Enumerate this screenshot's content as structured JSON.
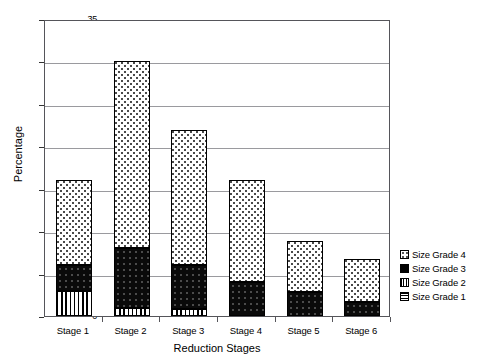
{
  "chart_data": {
    "type": "bar",
    "subtype": "stacked-bar",
    "title": "",
    "xlabel": "Reduction Stages",
    "ylabel": "Percentage",
    "categories": [
      "Stage 1",
      "Stage 2",
      "Stage 3",
      "Stage 4",
      "Stage 5",
      "Stage 6"
    ],
    "ylim": [
      0,
      35
    ],
    "yticks": [
      0,
      5,
      10,
      15,
      20,
      25,
      30,
      35
    ],
    "ytick_labels": [
      "0",
      "5",
      "10",
      "15",
      "20",
      "25",
      "30",
      "35"
    ],
    "grid": "horizontal",
    "legend_position": "right",
    "stack_order_bottom_to_top": [
      "Size Grade 1",
      "Size Grade 2",
      "Size Grade 3",
      "Size Grade 4"
    ],
    "series": [
      {
        "name": "Size Grade 1",
        "pattern": "horizontal-lines",
        "color": "#ffffff",
        "values": [
          0,
          0,
          0,
          0,
          0,
          0
        ]
      },
      {
        "name": "Size Grade 2",
        "pattern": "vertical-stripes",
        "color": "#ffffff",
        "values": [
          3.0,
          0.9,
          0.8,
          0,
          0,
          0
        ]
      },
      {
        "name": "Size Grade 3",
        "pattern": "solid-black",
        "color": "#000000",
        "values": [
          3.0,
          7.1,
          5.2,
          4.0,
          2.8,
          1.7
        ]
      },
      {
        "name": "Size Grade 4",
        "pattern": "sparse-dots",
        "color": "#ffffff",
        "values": [
          10.0,
          22.0,
          15.9,
          12.0,
          6.1,
          5.0
        ]
      }
    ],
    "totals": [
      16.0,
      30.0,
      21.9,
      16.0,
      8.9,
      6.7
    ]
  },
  "legend": {
    "items": [
      {
        "label": "Size Grade 4",
        "swatch": "sparse-dots-swatch"
      },
      {
        "label": "Size Grade 3",
        "swatch": "solid-black-swatch"
      },
      {
        "label": "Size Grade 2",
        "swatch": "vertical-stripes-swatch"
      },
      {
        "label": "Size Grade 1",
        "swatch": "horizontal-lines-swatch"
      }
    ]
  }
}
